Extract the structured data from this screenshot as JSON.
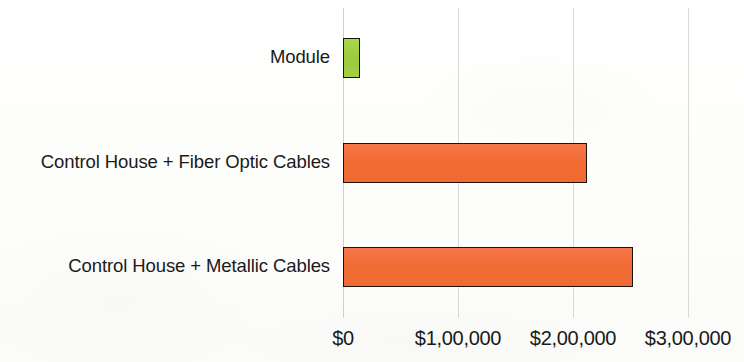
{
  "chart_data": {
    "type": "bar",
    "orientation": "horizontal",
    "title": "",
    "subtitle": "",
    "xlabel": "",
    "ylabel": "",
    "categories": [
      "Control House + Metallic Cables",
      "Control House + Fiber Optic Cables",
      "Module"
    ],
    "values": [
      252000,
      212000,
      15000
    ],
    "series": [
      {
        "name": "Cost",
        "values": [
          252000,
          212000,
          15000
        ]
      }
    ],
    "bar_colors": [
      "#f26c36",
      "#f26c36",
      "#9ccb3b"
    ],
    "bar_border_color": "#1d1208",
    "xlim": [
      0,
      300000
    ],
    "x_ticks": [
      0,
      100000,
      200000,
      300000
    ],
    "x_tick_labels": [
      "$0",
      "$1,00,000",
      "$2,00,000",
      "$3,00,000"
    ],
    "grid": true,
    "grid_axis": "x",
    "grid_color": "#d9d9d9",
    "legend": false,
    "legend_position": "none",
    "annotations": []
  },
  "axis": {
    "tick_labels": [
      "$0",
      "$1,00,000",
      "$2,00,000",
      "$3,00,000"
    ]
  },
  "bars": [
    {
      "label": "Module",
      "value": 15000,
      "color": "#9ccb3b"
    },
    {
      "label": "Control House + Fiber Optic Cables",
      "value": 212000,
      "color": "#f26c36"
    },
    {
      "label": "Control House + Metallic Cables",
      "value": 252000,
      "color": "#f26c36"
    }
  ]
}
